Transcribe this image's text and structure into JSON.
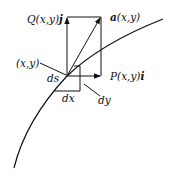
{
  "labels": {
    "q_vector": {
      "prefix": "Q",
      "args": "(x,y)",
      "unit": "j"
    },
    "a_vector": {
      "name": "a",
      "args": "(x,y)"
    },
    "p_vector": {
      "prefix": "P",
      "args": "(x,y)",
      "unit": "i"
    },
    "point": "(x,y)",
    "ds": "ds",
    "dx": "dx",
    "dy": "dy"
  },
  "colors": {
    "ink": "#111111",
    "background": "#ffffff"
  }
}
